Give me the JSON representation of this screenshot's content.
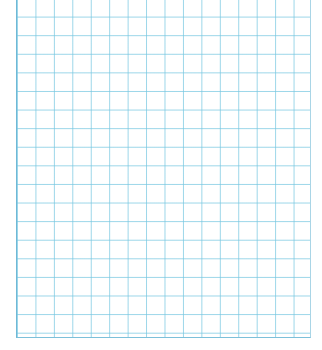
{
  "sheet": {
    "type": "graph-paper",
    "columns": 16,
    "rows": 18,
    "grid_color": "#78c8e1",
    "border_color": "#6fb8d6",
    "background": "#ffffff"
  }
}
